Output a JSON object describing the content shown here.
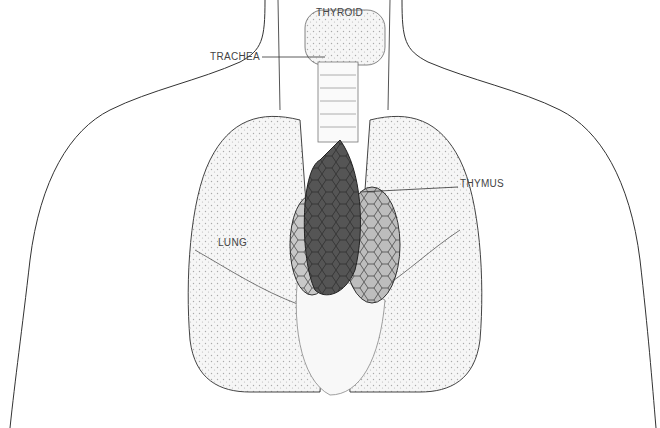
{
  "figure": {
    "labels": {
      "thyroid": "THYROID",
      "trachea": "TRACHEA",
      "thymus": "THYMUS",
      "lung": "LUNG"
    },
    "colors": {
      "line": "#333333",
      "lung_fill": "#f2f2f2",
      "thymus_dark": "#555555",
      "thymus_light": "#bdbdbd",
      "label_text": "#444444"
    }
  }
}
